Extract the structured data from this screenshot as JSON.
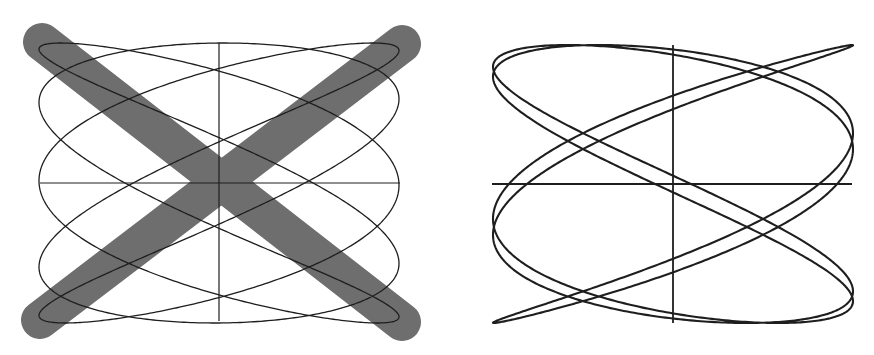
{
  "figures": [
    {
      "id": "left",
      "label": "incorrect-lissajous-figure",
      "marked_wrong": true,
      "center": [
        219,
        183
      ],
      "half_width": 180,
      "half_height": 140,
      "lissajous": {
        "x_freq": 5,
        "y_freq": 3,
        "phase": 0.55
      },
      "axes": {
        "x_from": 40,
        "x_to": 400,
        "y_from": 43,
        "y_to": 321
      },
      "cross": {
        "color": "#6e6e6e",
        "width": 38,
        "lines": [
          {
            "x1": 42,
            "y1": 42,
            "x2": 402,
            "y2": 322
          },
          {
            "x1": 402,
            "y1": 44,
            "x2": 40,
            "y2": 320
          }
        ]
      },
      "line_color": "#1e1e1e"
    },
    {
      "id": "right",
      "label": "correct-lissajous-figure",
      "marked_wrong": false,
      "center": [
        673,
        184
      ],
      "half_width": 180,
      "half_height": 139,
      "lissajous": {
        "x_freq": 5,
        "y_freq": 3,
        "phase": 0.1
      },
      "axes": {
        "x_from": 492,
        "x_to": 852,
        "y_from": 45,
        "y_to": 323
      },
      "line_color": "#1e1e1e"
    }
  ]
}
